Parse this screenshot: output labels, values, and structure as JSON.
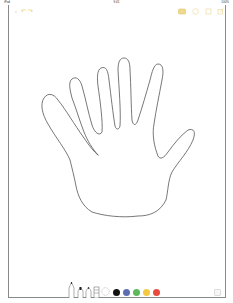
{
  "status_bar": {
    "device": "iPad",
    "time": "9:41",
    "battery": "100%"
  },
  "toolbar": {
    "back_icon": "chevron-left-icon",
    "undo_icon": "undo-icon",
    "redo_icon": "redo-icon",
    "right_icons": [
      "markup-pen-icon",
      "share-icon",
      "add-icon",
      "compose-icon"
    ],
    "accent_color": "#e8cf7a"
  },
  "canvas": {
    "drawing": "hand outline",
    "stroke_color": "#555555"
  },
  "tools": {
    "pens": [
      "pen",
      "marker",
      "pencil",
      "eraser",
      "lasso"
    ],
    "colors": [
      {
        "name": "black",
        "hex": "#111111",
        "selected": true
      },
      {
        "name": "blue",
        "hex": "#5b6db3"
      },
      {
        "name": "green",
        "hex": "#5cb85c"
      },
      {
        "name": "yellow",
        "hex": "#f5c842"
      },
      {
        "name": "red",
        "hex": "#e84a3c"
      }
    ]
  }
}
